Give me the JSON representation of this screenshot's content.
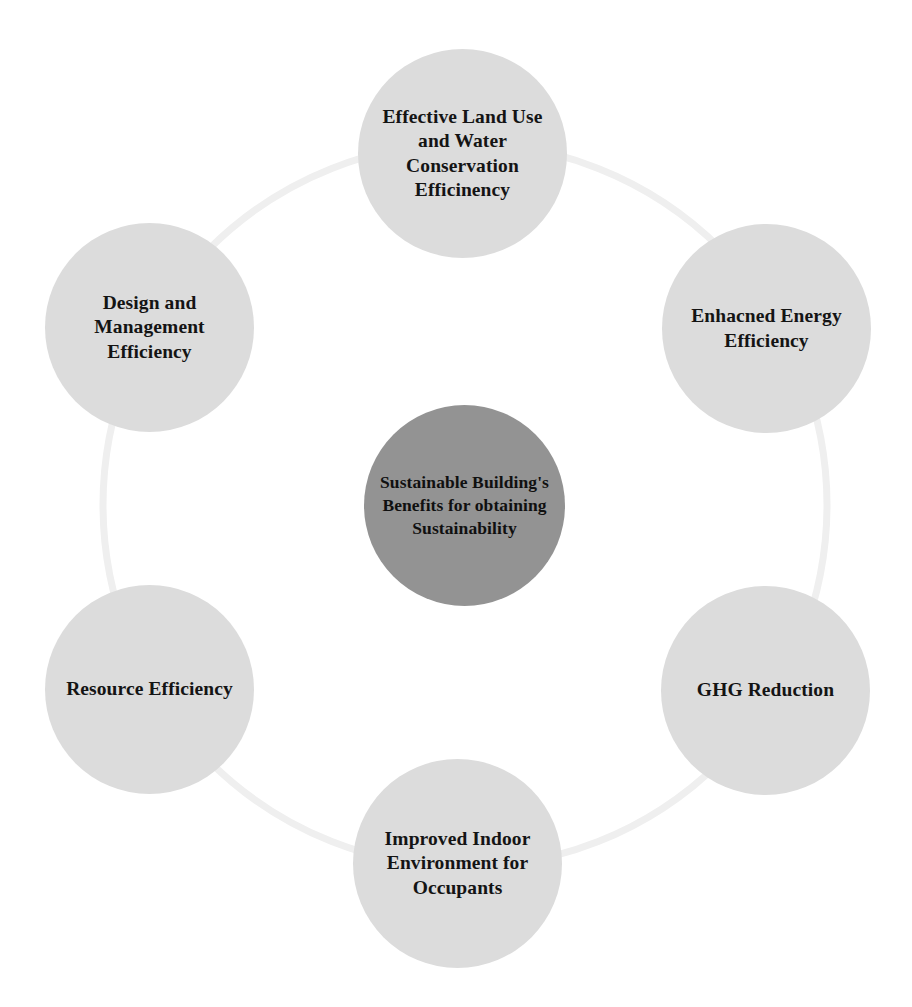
{
  "diagram": {
    "type": "cycle-hub-and-spoke",
    "title": "Sustainable Building's Benefits for obtaining Sustainability",
    "colors": {
      "background": "#ffffff",
      "satellite_fill": "#dcdcdc",
      "hub_fill": "#939393",
      "ring_stroke": "#efefef",
      "text": "#141414"
    },
    "hub": {
      "id": "hub",
      "label": "Sustainable Building's Benefits for obtaining Sustainability"
    },
    "nodes": [
      {
        "id": "top",
        "position": "top",
        "label": "Effective Land Use and Water Conservation Efficinency"
      },
      {
        "id": "top-right",
        "position": "top-right",
        "label": "Enhacned Energy Efficiency"
      },
      {
        "id": "bottom-right",
        "position": "bottom-right",
        "label": "GHG Reduction"
      },
      {
        "id": "bottom",
        "position": "bottom",
        "label": "Improved Indoor Environment for Occupants"
      },
      {
        "id": "bottom-left",
        "position": "bottom-left",
        "label": "Resource Efficiency"
      },
      {
        "id": "top-left",
        "position": "top-left",
        "label": "Design and Management Efficiency"
      }
    ]
  }
}
